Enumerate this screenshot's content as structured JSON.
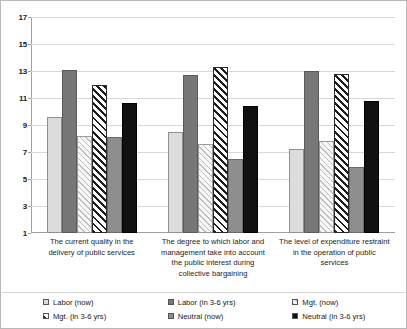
{
  "chart_data": {
    "type": "bar",
    "title": "",
    "subtitle": "",
    "xlabel": "",
    "ylabel": "",
    "ylim": [
      1,
      17
    ],
    "ytick_values": [
      17,
      15,
      13,
      11,
      9,
      7,
      5,
      3,
      1
    ],
    "ytick_labels": [
      "17",
      "15",
      "13",
      "11",
      "9",
      "7",
      "5",
      "3",
      "1"
    ],
    "grid": true,
    "legend_position": "bottom",
    "categories": [
      "The current quality in the delivery of public services",
      "The degree to which labor and management take into account the public interest during collective bargaining",
      "The level of expenditure restraint in the operation of public services"
    ],
    "series": [
      {
        "name": "Labor (now)",
        "swatch": "light-gray",
        "values": [
          9.6,
          8.5,
          7.2
        ]
      },
      {
        "name": "Labor (in 3-6 yrs)",
        "swatch": "dark-gray",
        "values": [
          13.1,
          12.7,
          13.0
        ]
      },
      {
        "name": "Mgt. (now)",
        "swatch": "light-hatch",
        "values": [
          8.2,
          7.6,
          7.8
        ]
      },
      {
        "name": "Mgt. (in 3-6 yrs)",
        "swatch": "dark-diagonal",
        "values": [
          12.0,
          13.3,
          12.8
        ]
      },
      {
        "name": "Neutral (now)",
        "swatch": "medium-gray",
        "values": [
          8.1,
          6.5,
          5.9
        ]
      },
      {
        "name": "Neutral (in 3-6 yrs)",
        "swatch": "black",
        "values": [
          10.6,
          10.4,
          10.8
        ]
      }
    ]
  },
  "legend": {
    "items": [
      {
        "label": "Labor (now)"
      },
      {
        "label": "Mgt. (in 3-6 yrs)"
      },
      {
        "label": "Labor (in 3-6 yrs)"
      },
      {
        "label": "Neutral (now)"
      },
      {
        "label": "Mgt. (now)"
      },
      {
        "label": "Neutral (in 3-6 yrs)"
      }
    ]
  }
}
